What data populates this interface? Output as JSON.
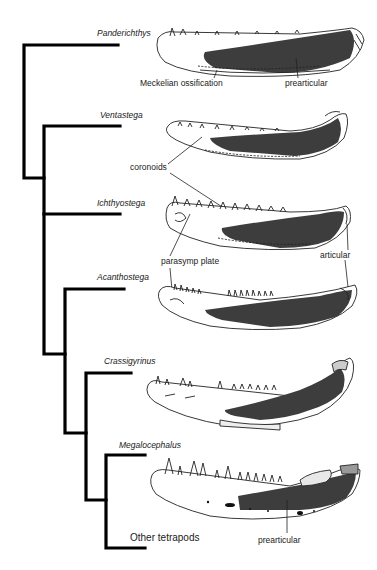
{
  "figure": {
    "type": "cladogram",
    "colors": {
      "tree_line": "#000000",
      "prearticular_fill": "#3d3d3d",
      "bone_outline": "#222222",
      "background": "#ffffff"
    }
  },
  "taxa": [
    {
      "name": "Panderichthys"
    },
    {
      "name": "Ventastega"
    },
    {
      "name": "Ichthyostega"
    },
    {
      "name": "Acanthostega"
    },
    {
      "name": "Crassigyrinus"
    },
    {
      "name": "Megalocephalus"
    },
    {
      "name": "Other tetrapods"
    }
  ],
  "annotations": {
    "meckelian": "Meckelian ossification",
    "prearticular_top": "prearticular",
    "coronoids": "coronoids",
    "parasymp": "parasymp plate",
    "articular": "articular",
    "prearticular_bottom": "prearticular"
  }
}
